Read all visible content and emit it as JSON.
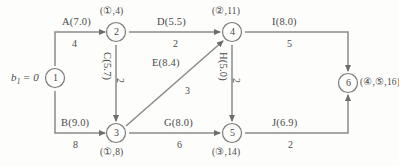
{
  "diagram": {
    "source_label": "b",
    "source_subscript": "1",
    "source_value": "= 0",
    "source_text": "b₁ = 0",
    "stroke_color": "#7d7d7d",
    "text_color": "#4a4a4a",
    "background": "#fdfdfc"
  },
  "nodes": [
    {
      "id": "1",
      "number": "1",
      "tag": "",
      "x": 55,
      "y": 78
    },
    {
      "id": "2",
      "number": "2",
      "tag": "(①,4)",
      "x": 116,
      "y": 32
    },
    {
      "id": "3",
      "number": "3",
      "tag": "(①,8)",
      "x": 116,
      "y": 133
    },
    {
      "id": "4",
      "number": "4",
      "tag": "(②,11)",
      "x": 232,
      "y": 32
    },
    {
      "id": "5",
      "number": "5",
      "tag": "(③,14)",
      "x": 232,
      "y": 133
    },
    {
      "id": "6",
      "number": "6",
      "tag": "(④,⑤,16)",
      "x": 348,
      "y": 83
    }
  ],
  "edges": [
    {
      "id": "A",
      "name": "A(7.0)",
      "weight": "4",
      "from": "1",
      "to": "2",
      "orientation": "horizontal"
    },
    {
      "id": "B",
      "name": "B(9.0)",
      "weight": "8",
      "from": "1",
      "to": "3",
      "orientation": "horizontal"
    },
    {
      "id": "C",
      "name": "C(5.7)",
      "weight": "2",
      "from": "2",
      "to": "3",
      "orientation": "vertical"
    },
    {
      "id": "D",
      "name": "D(5.5)",
      "weight": "2",
      "from": "2",
      "to": "4",
      "orientation": "horizontal"
    },
    {
      "id": "E",
      "name": "E(8.4)",
      "weight": "3",
      "from": "3",
      "to": "4",
      "orientation": "diagonal"
    },
    {
      "id": "G",
      "name": "G(8.0)",
      "weight": "6",
      "from": "3",
      "to": "5",
      "orientation": "horizontal"
    },
    {
      "id": "H",
      "name": "H(5.0)",
      "weight": "2",
      "from": "4",
      "to": "5",
      "orientation": "vertical"
    },
    {
      "id": "I",
      "name": "I(8.0)",
      "weight": "5",
      "from": "4",
      "to": "6",
      "orientation": "horizontal"
    },
    {
      "id": "J",
      "name": "J(6.9)",
      "weight": "2",
      "from": "5",
      "to": "6",
      "orientation": "horizontal"
    }
  ],
  "labels": {
    "edge_A_name": "A(7.0)",
    "edge_A_weight": "4",
    "edge_B_name": "B(9.0)",
    "edge_B_weight": "8",
    "edge_C_name": "C(5.7)",
    "edge_C_weight": "2",
    "edge_D_name": "D(5.5)",
    "edge_D_weight": "2",
    "edge_E_name": "E(8.4)",
    "edge_E_weight": "3",
    "edge_G_name": "G(8.0)",
    "edge_G_weight": "6",
    "edge_H_name": "H(5.0)",
    "edge_H_weight": "2",
    "edge_I_name": "I(8.0)",
    "edge_I_weight": "5",
    "edge_J_name": "J(6.9)",
    "edge_J_weight": "2",
    "node_1_num": "1",
    "node_2_num": "2",
    "node_3_num": "3",
    "node_4_num": "4",
    "node_5_num": "5",
    "node_6_num": "6",
    "node_2_tag": "(①,4)",
    "node_3_tag": "(①,8)",
    "node_4_tag": "(②,11)",
    "node_5_tag": "(③,14)",
    "node_6_tag": "(④,⑤,16)",
    "source_prefix": "b",
    "source_sub": "1",
    "source_eq": "= 0"
  }
}
